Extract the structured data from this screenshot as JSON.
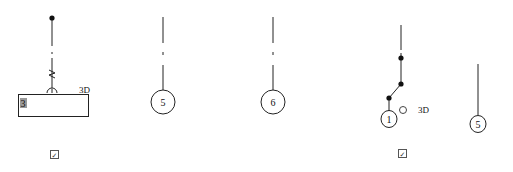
{
  "diagram": {
    "background": "#ffffff",
    "stroke_color": "#222222",
    "groups": [
      {
        "id": "group-1",
        "badge_label": "3",
        "tag_label": "3D",
        "has_checkbox": true
      },
      {
        "id": "group-2",
        "node_label": "5"
      },
      {
        "id": "group-3",
        "node_label": "6"
      },
      {
        "id": "group-4",
        "node_label": "1",
        "tag_label": "3D",
        "has_checkbox": true
      },
      {
        "id": "group-5",
        "node_label": "5"
      }
    ],
    "checkbox_glyph": "✓"
  }
}
